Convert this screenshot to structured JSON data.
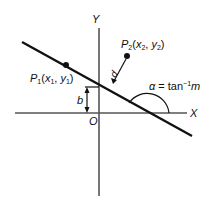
{
  "diagram": {
    "axes": {
      "x_label": "X",
      "y_label": "Y",
      "origin_label": "O"
    },
    "line": {
      "slope_symbol": "m",
      "intercept_label": "b"
    },
    "points": [
      {
        "name": "P",
        "subscript": "1",
        "coords": "(x1, y1)",
        "x_sym": "x",
        "x_sub": "1",
        "y_sym": "y",
        "y_sub": "1"
      },
      {
        "name": "P",
        "subscript": "2",
        "coords": "(x2, y2)",
        "x_sym": "x",
        "x_sub": "2",
        "y_sym": "y",
        "y_sub": "2"
      }
    ],
    "distance_label": "d",
    "angle_label": {
      "alpha": "α",
      "eq": " = tan",
      "sup": "−1",
      "m": "m"
    },
    "colors": {
      "line": "#111111",
      "axis": "#555555",
      "text": "#111111"
    }
  }
}
